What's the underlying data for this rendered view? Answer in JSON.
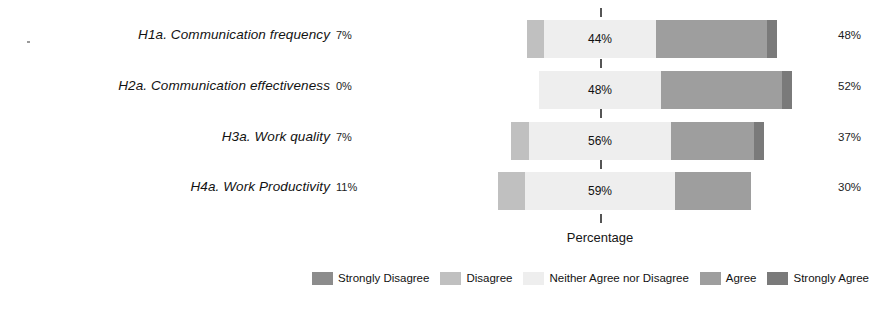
{
  "chart_data": {
    "type": "bar",
    "subtype": "diverging-stacked-likert",
    "title": "",
    "xlabel": "Percentage",
    "ylabel": "",
    "grid": false,
    "legend_position": "bottom",
    "categories": [
      "H1a. Communication frequency",
      "H2a. Communication effectiveness",
      "H3a. Work quality",
      "H4a. Work Productivity"
    ],
    "series": [
      {
        "name": "Strongly Disagree",
        "color": "#8c8c8c",
        "values": [
          0,
          0,
          0,
          0
        ]
      },
      {
        "name": "Disagree",
        "color": "#c0c0c0",
        "values": [
          7,
          0,
          7,
          11
        ]
      },
      {
        "name": "Neither Agree nor Disagree",
        "color": "#eeeeee",
        "values": [
          44,
          48,
          56,
          59
        ]
      },
      {
        "name": "Agree",
        "color": "#9e9e9e",
        "values": [
          44,
          48,
          33,
          30
        ]
      },
      {
        "name": "Strongly Agree",
        "color": "#7a7a7a",
        "values": [
          4,
          4,
          4,
          0
        ]
      }
    ],
    "left_totals": [
      "7%",
      "0%",
      "7%",
      "11%"
    ],
    "right_totals": [
      "48%",
      "52%",
      "37%",
      "30%"
    ],
    "center_labels": [
      "44%",
      "48%",
      "56%",
      "59%"
    ],
    "center_reference": 0,
    "units": "%"
  },
  "axis": {
    "x_title": "Percentage"
  },
  "legend": {
    "items": [
      {
        "label": "Strongly Disagree",
        "color": "#8c8c8c"
      },
      {
        "label": "Disagree",
        "color": "#c0c0c0"
      },
      {
        "label": "Neither Agree nor Disagree",
        "color": "#eeeeee"
      },
      {
        "label": "Agree",
        "color": "#9e9e9e"
      },
      {
        "label": "Strongly Agree",
        "color": "#7a7a7a"
      }
    ]
  },
  "rows": [
    {
      "label": "H1a. Communication frequency",
      "left_pct": "7%",
      "center_pct": "44%",
      "right_pct": "48%",
      "segments": [
        {
          "name": "Disagree",
          "value": 7,
          "color": "#c0c0c0"
        },
        {
          "name": "Neither Agree nor Disagree",
          "value": 44,
          "color": "#eeeeee"
        },
        {
          "name": "Agree",
          "value": 44,
          "color": "#9e9e9e"
        },
        {
          "name": "Strongly Agree",
          "value": 4,
          "color": "#7a7a7a"
        }
      ]
    },
    {
      "label": "H2a. Communication effectiveness",
      "left_pct": "0%",
      "center_pct": "48%",
      "right_pct": "52%",
      "segments": [
        {
          "name": "Neither Agree nor Disagree",
          "value": 48,
          "color": "#eeeeee"
        },
        {
          "name": "Agree",
          "value": 48,
          "color": "#9e9e9e"
        },
        {
          "name": "Strongly Agree",
          "value": 4,
          "color": "#7a7a7a"
        }
      ]
    },
    {
      "label": "H3a. Work quality",
      "left_pct": "7%",
      "center_pct": "56%",
      "right_pct": "37%",
      "segments": [
        {
          "name": "Disagree",
          "value": 7,
          "color": "#c0c0c0"
        },
        {
          "name": "Neither Agree nor Disagree",
          "value": 56,
          "color": "#eeeeee"
        },
        {
          "name": "Agree",
          "value": 33,
          "color": "#9e9e9e"
        },
        {
          "name": "Strongly Agree",
          "value": 4,
          "color": "#7a7a7a"
        }
      ]
    },
    {
      "label": "H4a. Work Productivity",
      "left_pct": "11%",
      "center_pct": "59%",
      "right_pct": "30%",
      "segments": [
        {
          "name": "Disagree",
          "value": 11,
          "color": "#c0c0c0"
        },
        {
          "name": "Neither Agree nor Disagree",
          "value": 59,
          "color": "#eeeeee"
        },
        {
          "name": "Agree",
          "value": 30,
          "color": "#9e9e9e"
        }
      ]
    }
  ]
}
